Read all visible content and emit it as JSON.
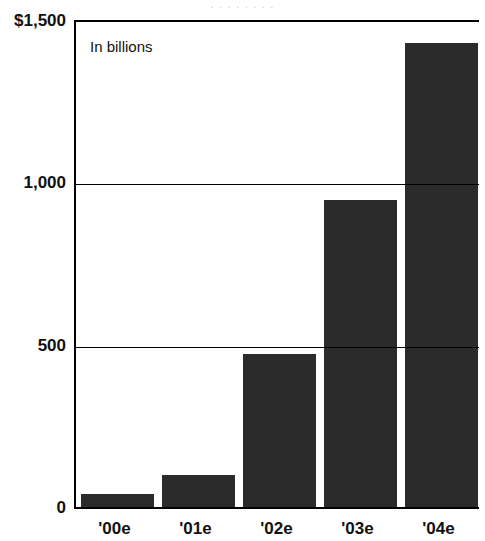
{
  "top_bleed_text": ". . . . . . . .",
  "panel_note": "In billions",
  "chart_data": {
    "type": "bar",
    "title": "",
    "subtitle": "In billions",
    "xlabel": "",
    "ylabel": "",
    "categories": [
      "'00e",
      "'01e",
      "'02e",
      "'03e",
      "'04e"
    ],
    "values": [
      40,
      100,
      470,
      945,
      1430
    ],
    "ylim": [
      0,
      1500
    ],
    "yticks": [
      0,
      500,
      1000,
      1500
    ],
    "ytick_labels": [
      "0",
      "500",
      "1,000",
      "$1,500"
    ],
    "grid": true,
    "legend": "none",
    "bar_color": "#2b2b2b",
    "axis_color": "#000000",
    "background": "#ffffff"
  },
  "axis": {
    "y_labels": [
      {
        "text": "$1,500",
        "value": 1500
      },
      {
        "text": "1,000",
        "value": 1000
      },
      {
        "text": "500",
        "value": 500
      },
      {
        "text": "0",
        "value": 0
      }
    ],
    "x_labels": [
      "'00e",
      "'01e",
      "'02e",
      "'03e",
      "'04e"
    ]
  }
}
